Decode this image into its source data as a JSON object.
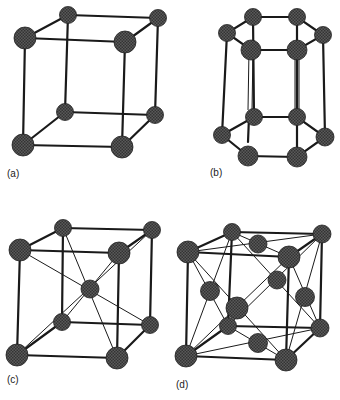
{
  "figure": {
    "panels": [
      {
        "id": "a",
        "label": "(a)",
        "structure": "simple cubic",
        "atoms": 8
      },
      {
        "id": "b",
        "label": "(b)",
        "structure": "hexagonal prism",
        "atoms": 12
      },
      {
        "id": "c",
        "label": "(c)",
        "structure": "body-centered cubic",
        "atoms": 9
      },
      {
        "id": "d",
        "label": "(d)",
        "structure": "face-centered cubic",
        "atoms": 14
      }
    ],
    "colors": {
      "atom": "#4a4a4a",
      "bond": "#1a1a1a",
      "background": "#ffffff"
    }
  }
}
